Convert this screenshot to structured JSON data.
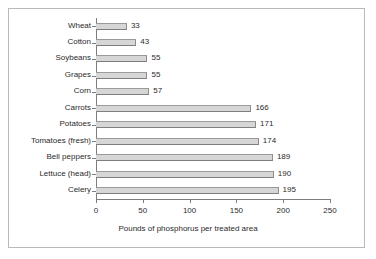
{
  "chart_data": {
    "type": "bar",
    "orientation": "horizontal",
    "title": "",
    "xlabel": "Pounds of phosphorus per treated area",
    "ylabel": "",
    "xlim": [
      0,
      250
    ],
    "xticks": [
      0,
      50,
      100,
      150,
      200,
      250
    ],
    "grid": false,
    "legend": false,
    "show_value_labels": true,
    "categories": [
      "Wheat",
      "Cotton",
      "Soybeans",
      "Grapes",
      "Corn",
      "Carrots",
      "Potatoes",
      "Tomatoes (fresh)",
      "Bell peppers",
      "Lettuce (head)",
      "Celery"
    ],
    "values": [
      33,
      43,
      55,
      55,
      57,
      166,
      171,
      174,
      189,
      190,
      195
    ],
    "colors": {
      "bar_fill": "#d6d6d6",
      "bar_edge": "#8d8d8d",
      "axis": "#7d7d7d",
      "text": "#2b2b2b",
      "frame": "#b9b9b9",
      "background": "#ffffff"
    }
  }
}
